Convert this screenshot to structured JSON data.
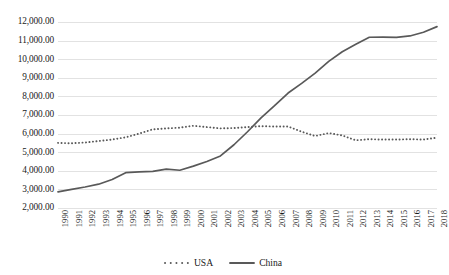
{
  "chart_data": {
    "type": "line",
    "title": "",
    "subtitle": "",
    "xlabel": "",
    "ylabel": "",
    "grid": true,
    "legend_position": "bottom",
    "xlim": [
      1990,
      2018
    ],
    "ylim": [
      2000,
      12000
    ],
    "y_tick_step": 1000,
    "y_tick_labels": [
      "12,000.00",
      "11,000.00",
      "10,000.00",
      "9,000.00",
      "8,000.00",
      "7,000.00",
      "6,000.00",
      "5,000.00",
      "4,000.00",
      "3,000.00",
      "2,000.00"
    ],
    "y_tick_values": [
      12000,
      11000,
      10000,
      9000,
      8000,
      7000,
      6000,
      5000,
      4000,
      3000,
      2000
    ],
    "categories": [
      "1990",
      "1991",
      "1992",
      "1993",
      "1994",
      "1995",
      "1996",
      "1997",
      "1998",
      "1999",
      "2000",
      "2001",
      "2002",
      "2003",
      "2004",
      "2005",
      "2006",
      "2007",
      "2008",
      "2009",
      "2010",
      "2011",
      "2012",
      "2013",
      "2014",
      "2015",
      "2016",
      "2017",
      "2018"
    ],
    "series": [
      {
        "name": "USA",
        "style": "dotted",
        "color": "#595959",
        "values": [
          5500,
          5480,
          5520,
          5600,
          5680,
          5800,
          6000,
          6230,
          6280,
          6320,
          6420,
          6350,
          6280,
          6300,
          6350,
          6400,
          6380,
          6380,
          6100,
          5870,
          6030,
          5900,
          5640,
          5700,
          5680,
          5680,
          5700,
          5680,
          5780
        ]
      },
      {
        "name": "China",
        "style": "solid",
        "color": "#595959",
        "values": [
          2870,
          3000,
          3130,
          3280,
          3530,
          3900,
          3940,
          3970,
          4090,
          4030,
          4250,
          4500,
          4800,
          5400,
          6100,
          6850,
          7500,
          8180,
          8700,
          9250,
          9880,
          10400,
          10800,
          11180,
          11190,
          11170,
          11250,
          11450,
          11750
        ]
      }
    ]
  },
  "legend": {
    "items": [
      {
        "label": "USA",
        "marker": "dotted-line-swatch"
      },
      {
        "label": "China",
        "marker": "solid-line-swatch"
      }
    ]
  },
  "colors": {
    "line": "#595959",
    "gridline": "#e2e2e2",
    "text": "#1a1a1a",
    "background": "#ffffff"
  }
}
